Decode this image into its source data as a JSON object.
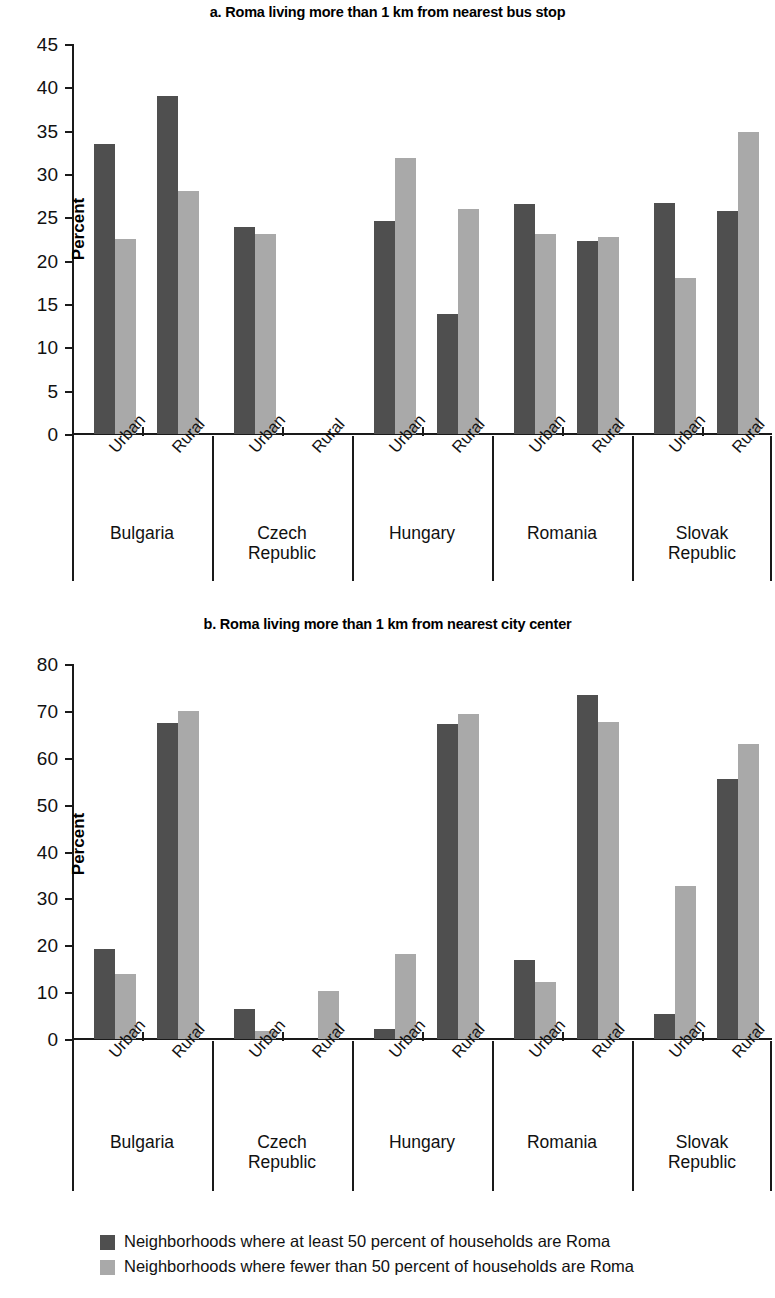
{
  "legend": {
    "series": [
      {
        "key": "dark",
        "label": "Neighborhoods where at least 50 percent of households are Roma",
        "color": "#4f4f4f"
      },
      {
        "key": "light",
        "label": "Neighborhoods where fewer than 50 percent of households are Roma",
        "color": "#a9a9a9"
      }
    ]
  },
  "panel_a": {
    "title": "a. Roma living more than 1 km from nearest bus stop",
    "ylabel": "Percent",
    "yticks": [
      "0",
      "5",
      "10",
      "15",
      "20",
      "25",
      "30",
      "35",
      "40",
      "45"
    ]
  },
  "panel_b": {
    "title": "b. Roma living more than 1 km from nearest city center",
    "ylabel": "Percent",
    "yticks": [
      "0",
      "10",
      "20",
      "30",
      "40",
      "50",
      "60",
      "70",
      "80"
    ]
  },
  "categories": {
    "countries": [
      "Bulgaria",
      "Czech\nRepublic",
      "Hungary",
      "Romania",
      "Slovak\nRepublic"
    ],
    "settlements": [
      "Urban",
      "Rural"
    ]
  },
  "chart_data": [
    {
      "type": "bar",
      "title": "a. Roma living more than 1 km from nearest bus stop",
      "xlabel": "",
      "ylabel": "Percent",
      "ylim": [
        0,
        45
      ],
      "ytick_step": 5,
      "grid": false,
      "legend_position": "bottom",
      "group_labels": [
        "Bulgaria",
        "Czech Republic",
        "Hungary",
        "Romania",
        "Slovak Republic"
      ],
      "categories": [
        "Bulgaria Urban",
        "Bulgaria Rural",
        "Czech Republic Urban",
        "Czech Republic Rural",
        "Hungary Urban",
        "Hungary Rural",
        "Romania Urban",
        "Romania Rural",
        "Slovak Republic Urban",
        "Slovak Republic Rural"
      ],
      "series": [
        {
          "name": "Neighborhoods where at least 50 percent of households are Roma",
          "color": "#4f4f4f",
          "values": [
            33.5,
            39.0,
            23.9,
            null,
            24.6,
            13.9,
            26.5,
            22.3,
            26.7,
            25.7
          ]
        },
        {
          "name": "Neighborhoods where fewer than 50 percent of households are Roma",
          "color": "#a9a9a9",
          "values": [
            22.5,
            28.0,
            23.1,
            null,
            31.8,
            26.0,
            23.1,
            22.7,
            18.0,
            34.8
          ]
        }
      ]
    },
    {
      "type": "bar",
      "title": "b. Roma living more than 1 km from nearest city center",
      "xlabel": "",
      "ylabel": "Percent",
      "ylim": [
        0,
        80
      ],
      "ytick_step": 10,
      "grid": false,
      "legend_position": "bottom",
      "group_labels": [
        "Bulgaria",
        "Czech Republic",
        "Hungary",
        "Romania",
        "Slovak Republic"
      ],
      "categories": [
        "Bulgaria Urban",
        "Bulgaria Rural",
        "Czech Republic Urban",
        "Czech Republic Rural",
        "Hungary Urban",
        "Hungary Rural",
        "Romania Urban",
        "Romania Rural",
        "Slovak Republic Urban",
        "Slovak Republic Rural"
      ],
      "series": [
        {
          "name": "Neighborhoods where at least 50 percent of households are Roma",
          "color": "#4f4f4f",
          "values": [
            19.2,
            67.5,
            6.4,
            null,
            2.2,
            67.2,
            16.9,
            73.4,
            5.3,
            55.4
          ]
        },
        {
          "name": "Neighborhoods where fewer than 50 percent of households are Roma",
          "color": "#a9a9a9",
          "values": [
            13.9,
            70.0,
            1.7,
            10.2,
            18.1,
            69.4,
            12.1,
            67.6,
            32.7,
            62.9
          ]
        }
      ]
    }
  ]
}
